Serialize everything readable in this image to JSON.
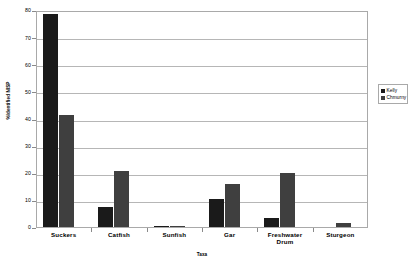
{
  "chart_data": {
    "type": "bar",
    "title": "",
    "xlabel": "Taxa",
    "ylabel": "%Identified NISP",
    "ylim": [
      0,
      80
    ],
    "yticks": [
      0,
      10,
      20,
      30,
      40,
      50,
      60,
      70,
      80
    ],
    "ytick_labels": [
      "0",
      "10",
      "20",
      "30",
      "40",
      "50",
      "60",
      "70",
      "80"
    ],
    "grid": "horizontal",
    "legend_position": "right",
    "categories": [
      "Suckers",
      "Catfish",
      "Sunfish",
      "Gar",
      "Freshwater Drum",
      "Sturgeon"
    ],
    "category_labels": [
      "Suckers",
      "Catfish",
      "Sunfish",
      "Gar",
      "Freshwater\nDrum",
      "Sturgeon"
    ],
    "series": [
      {
        "name": "Kelly",
        "color": "#1a1a1a",
        "values": [
          78.5,
          7.2,
          0.4,
          10.4,
          3.4,
          0
        ]
      },
      {
        "name": "Chmurny",
        "color": "#3f3f3f",
        "values": [
          41.3,
          20.6,
          0.5,
          16.0,
          20.0,
          1.5
        ]
      }
    ]
  },
  "legend": {
    "entries": [
      {
        "label": "Kelly",
        "color": "#1a1a1a"
      },
      {
        "label": "Chmurny",
        "color": "#3f3f3f"
      }
    ]
  },
  "axes": {
    "y_title": "%Identified NISP",
    "x_title": "Taxa"
  }
}
